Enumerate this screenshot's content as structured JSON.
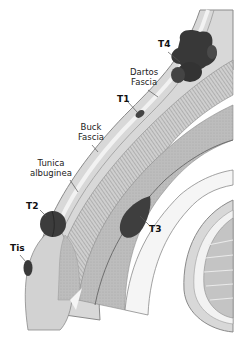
{
  "diagram": {
    "labels": [
      {
        "id": "t4",
        "text": "T4",
        "bold": true,
        "x": 162,
        "y": 44
      },
      {
        "id": "dartos",
        "text_lines": [
          "Dartos",
          "Fascia"
        ],
        "x": 130,
        "y": 70
      },
      {
        "id": "t1",
        "text": "T1",
        "bold": true,
        "x": 118,
        "y": 97
      },
      {
        "id": "buck",
        "text_lines": [
          "Buck",
          "Fascia"
        ],
        "x": 80,
        "y": 123
      },
      {
        "id": "tunica",
        "text_lines": [
          "Tunica",
          "albuginea"
        ],
        "x": 45,
        "y": 160
      },
      {
        "id": "t2",
        "text": "T2",
        "bold": true,
        "x": 28,
        "y": 200
      },
      {
        "id": "t3",
        "text": "T3",
        "bold": true,
        "x": 150,
        "y": 225
      },
      {
        "id": "tis",
        "text": "Tis",
        "bold": true,
        "x": 11,
        "y": 243
      }
    ],
    "colors": {
      "tumor": "#3a3a3a",
      "tumor_highlight": "#5a5a5a",
      "skin": "#d6d6d6",
      "fascia": "#eeeeee",
      "corpus": "#b9b9b9",
      "spongiosum": "#c8c8c8",
      "outline": "#8a8a8a",
      "leader": "#555555"
    }
  }
}
